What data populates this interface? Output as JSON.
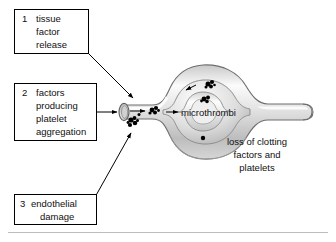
{
  "figure": {
    "type": "biological-process-diagram"
  },
  "callouts": [
    {
      "number": "1",
      "lines": [
        "tissue",
        "factor",
        "release"
      ],
      "box": {
        "x": 14,
        "y": 9,
        "w": 74,
        "h": 44
      }
    },
    {
      "number": "2",
      "lines": [
        "factors",
        "producing",
        "platelet",
        "aggregation"
      ],
      "box": {
        "x": 14,
        "y": 83,
        "w": 82,
        "h": 57
      }
    },
    {
      "number": "3",
      "lines": [
        "endothelial",
        "damage"
      ],
      "box": {
        "x": 14,
        "y": 194,
        "w": 82,
        "h": 30
      }
    }
  ],
  "labels": {
    "microthrombi": "microthrombi",
    "loss_of_clotting": [
      "loss of clotting",
      "factors and",
      "platelets"
    ]
  },
  "colors": {
    "stroke": "#000000",
    "vessel_stroke": "#6e6e6e",
    "vessel_fill_light": "#f2f2f2",
    "vessel_fill_mid": "#d9d9d9",
    "vessel_fill_dark": "#b4b4b4",
    "platelet": "#000000",
    "rule": "#bdbdbd",
    "background": "#ffffff"
  },
  "platelet_clusters": {
    "inlet_wall": 2,
    "inlet_lumen": 1,
    "upper_loop": 2,
    "middle_loop": 1,
    "lower_loop": 1
  }
}
